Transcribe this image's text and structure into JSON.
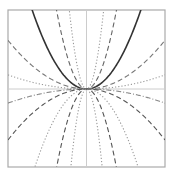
{
  "chart_data": {
    "type": "line",
    "title": "",
    "xlabel": "",
    "ylabel": "",
    "xlim": [
      -1,
      1
    ],
    "ylim": [
      -1,
      1
    ],
    "grid": false,
    "legend": null,
    "axes_through_origin": true,
    "function_family": "y = a * x^2",
    "series": [
      {
        "name": "a=2.1",
        "a": 2.1,
        "style": "solid",
        "color": "#333333",
        "width": 1.6
      },
      {
        "name": "a=6.9",
        "a": 6.9,
        "style": "dashed",
        "color": "#666666",
        "width": 1.1
      },
      {
        "name": "a=21",
        "a": 21,
        "style": "dotted",
        "color": "#999999",
        "width": 1.1
      },
      {
        "name": "a=0.62",
        "a": 0.62,
        "style": "dashed",
        "color": "#777777",
        "width": 1.1
      },
      {
        "name": "a=0.18",
        "a": 0.18,
        "style": "dotted",
        "color": "#999999",
        "width": 1.1
      },
      {
        "name": "a=-0.18",
        "a": -0.18,
        "style": "dashdot",
        "color": "#888888",
        "width": 1.1
      },
      {
        "name": "a=-0.65",
        "a": -0.65,
        "style": "dashed",
        "color": "#555555",
        "width": 1.1
      },
      {
        "name": "a=-2.3",
        "a": -2.3,
        "style": "dotted",
        "color": "#999999",
        "width": 1.1
      },
      {
        "name": "a=-6.9",
        "a": -6.9,
        "style": "dashed",
        "color": "#555555",
        "width": 1.1
      },
      {
        "name": "a=-25",
        "a": -25,
        "style": "dotted",
        "color": "#999999",
        "width": 1.1
      }
    ]
  },
  "frame": {
    "left": 8,
    "top": 10,
    "right": 165,
    "bottom": 167,
    "color": "#aaaaaa"
  },
  "axes_color": "#cccccc"
}
